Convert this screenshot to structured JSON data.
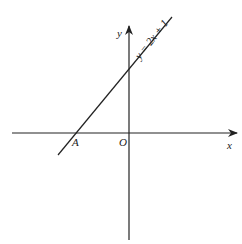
{
  "diagram": {
    "type": "coordinate-plane",
    "line_equation": "y = 2x + 1",
    "labels": {
      "x_axis": "x",
      "y_axis": "y",
      "origin": "O",
      "point_a": "A",
      "line": "y = 2x + 1"
    },
    "colors": {
      "stroke": "#222222",
      "background": "#ffffff"
    }
  }
}
